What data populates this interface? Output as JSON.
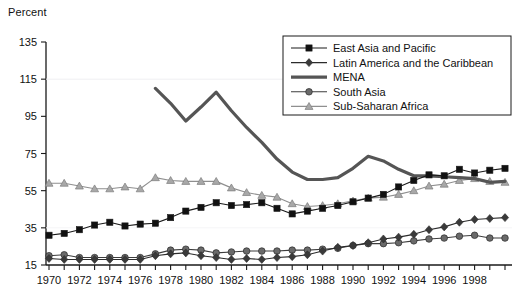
{
  "chart_data": {
    "type": "line",
    "title": "",
    "ylabel": "Percent",
    "xlabel": "",
    "ylim": [
      15,
      135
    ],
    "yticks": [
      15,
      35,
      55,
      75,
      95,
      115,
      135
    ],
    "xlim": [
      1970,
      2000
    ],
    "xticks": [
      1970,
      1971,
      1972,
      1973,
      1974,
      1975,
      1976,
      1977,
      1978,
      1979,
      1980,
      1981,
      1982,
      1983,
      1984,
      1985,
      1986,
      1987,
      1988,
      1989,
      1990,
      1991,
      1992,
      1993,
      1994,
      1995,
      1996,
      1997,
      1998,
      1999,
      2000
    ],
    "xtick_labels": [
      "1970",
      "",
      "1972",
      "",
      "1974",
      "",
      "1976",
      "",
      "1978",
      "",
      "1980",
      "",
      "1982",
      "",
      "1984",
      "",
      "1986",
      "",
      "1988",
      "",
      "1990",
      "",
      "1992",
      "",
      "1994",
      "",
      "1996",
      "",
      "1998",
      "",
      ""
    ],
    "grid": false,
    "legend_position": "top-right",
    "x": [
      1970,
      1971,
      1972,
      1973,
      1974,
      1975,
      1976,
      1977,
      1978,
      1979,
      1980,
      1981,
      1982,
      1983,
      1984,
      1985,
      1986,
      1987,
      1988,
      1989,
      1990,
      1991,
      1992,
      1993,
      1994,
      1995,
      1996,
      1997,
      1998,
      1999,
      2000
    ],
    "series": [
      {
        "name": "East Asia and Pacific",
        "marker": "square",
        "color": "#1a1a1a",
        "marker_color": "#111111",
        "line_width": 1.1,
        "values": [
          31,
          32,
          34,
          36.5,
          38,
          36,
          37,
          37.5,
          40.5,
          44,
          46,
          48.5,
          47,
          47.5,
          48.5,
          45.5,
          42.5,
          44,
          45.5,
          47,
          49,
          51,
          53,
          57,
          60.5,
          63.5,
          63,
          66.5,
          64.5,
          66,
          67
        ]
      },
      {
        "name": "Latin America and the Caribbean",
        "marker": "diamond",
        "color": "#2b2b2b",
        "marker_color": "#3a3a3a",
        "line_width": 1.1,
        "values": [
          18.5,
          18,
          18,
          18,
          18,
          18,
          18,
          20,
          21,
          21.5,
          20,
          19,
          18,
          18.5,
          18,
          19,
          19.5,
          20.5,
          22.5,
          24.5,
          25.5,
          27,
          29,
          30,
          31.5,
          34,
          35.5,
          38,
          39.5,
          40,
          40.5
        ]
      },
      {
        "name": "MENA",
        "marker": "none",
        "color": "#555555",
        "marker_color": "#555555",
        "line_width": 3.2,
        "values": [
          null,
          null,
          null,
          null,
          null,
          null,
          null,
          110,
          102,
          92.5,
          100,
          108,
          98,
          89,
          81,
          72,
          65,
          61,
          61,
          62,
          67,
          73.5,
          71,
          66.5,
          63,
          63,
          62.5,
          62,
          61.5,
          59.5,
          60
        ]
      },
      {
        "name": "South Asia",
        "marker": "circle",
        "color": "#3d3d3d",
        "marker_color": "#6a6a6a",
        "line_width": 1.1,
        "values": [
          20,
          20.5,
          19,
          19,
          19,
          19,
          19,
          21,
          23,
          23.5,
          23,
          21.5,
          22,
          22.5,
          22.5,
          22.5,
          23,
          23,
          23.5,
          24,
          25.5,
          26.5,
          26.5,
          27,
          28,
          29,
          29.5,
          30.5,
          31,
          29.5,
          29.5
        ]
      },
      {
        "name": "Sub-Saharan Africa",
        "marker": "triangle",
        "color": "#8f8f8f",
        "marker_color": "#a8a8a8",
        "line_width": 1.1,
        "values": [
          59,
          59,
          57.5,
          56,
          56,
          57,
          56,
          62,
          60.5,
          60,
          60,
          60,
          56.5,
          54,
          52.5,
          51.5,
          48,
          46.5,
          47,
          48,
          49.5,
          51,
          51.5,
          53,
          55,
          57.5,
          58.5,
          60.5,
          61.5,
          60,
          59.5
        ]
      }
    ]
  },
  "legend": {
    "items": [
      {
        "label": "East Asia and Pacific",
        "marker": "square"
      },
      {
        "label": "Latin America and the Caribbean",
        "marker": "diamond"
      },
      {
        "label": "MENA",
        "marker": "thickline"
      },
      {
        "label": "South Asia",
        "marker": "circle"
      },
      {
        "label": "Sub-Saharan Africa",
        "marker": "triangle"
      }
    ]
  }
}
